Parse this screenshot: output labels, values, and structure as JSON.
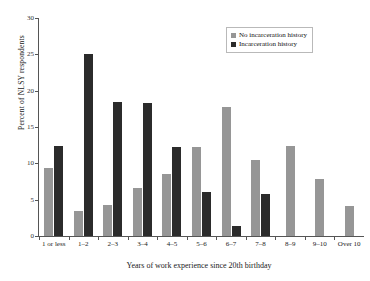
{
  "chart_data": {
    "type": "bar",
    "title": "",
    "xlabel": "Years of work experience since 20th birthday",
    "ylabel": "Percent of NLSY respondents",
    "ylim": [
      0,
      30
    ],
    "yticks": [
      0,
      5,
      10,
      15,
      20,
      25,
      30
    ],
    "grid": false,
    "legend_position": "top-right",
    "categories": [
      "1 or less",
      "1–2",
      "2–3",
      "3–4",
      "4–5",
      "5–6",
      "6–7",
      "7–8",
      "8–9",
      "9–10",
      "Over 10"
    ],
    "series": [
      {
        "name": "No incarceration history",
        "color": "#969696",
        "values": [
          9.4,
          3.4,
          4.3,
          6.6,
          8.5,
          12.3,
          17.8,
          10.4,
          12.4,
          7.9,
          4.1
        ]
      },
      {
        "name": "Incarceration history",
        "color": "#2b2b2b",
        "values": [
          12.4,
          25.0,
          18.5,
          18.3,
          12.3,
          6.1,
          1.4,
          5.8,
          0,
          0,
          0
        ]
      }
    ]
  },
  "legend": {
    "entries": [
      {
        "label": "No incarceration history"
      },
      {
        "label": "Incarceration history"
      }
    ]
  }
}
